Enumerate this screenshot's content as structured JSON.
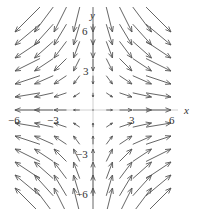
{
  "figure": {
    "type": "vector-field",
    "field": "F(x, y) = (x, -y)",
    "axes": {
      "x_label": "x",
      "y_label": "y",
      "x_range": [
        -6,
        6
      ],
      "y_range": [
        -6,
        6
      ],
      "x_tick_labels": [
        "-6",
        "-3",
        "3",
        "6"
      ],
      "y_tick_labels": [
        "6",
        "3",
        "-3",
        "-6"
      ]
    },
    "grid": {
      "x_values": [
        -6,
        -4.5,
        -3,
        -1.5,
        0,
        1.5,
        3,
        4.5,
        6
      ],
      "y_values": [
        6,
        5,
        4,
        3,
        2,
        1,
        0,
        -1,
        -2,
        -3,
        -4,
        -5,
        -6
      ]
    },
    "colors": {
      "arrow": "#555555",
      "axis": "#bbbbbb",
      "label": "#333333"
    }
  },
  "labels": {
    "x_axis": "x",
    "y_axis": "y",
    "x_neg6": "−6",
    "x_neg3": "−3",
    "x_pos3": "3",
    "x_pos6": "6",
    "y_pos6": "6",
    "y_pos3": "3",
    "y_neg3": "−3",
    "y_neg6": "−6"
  }
}
